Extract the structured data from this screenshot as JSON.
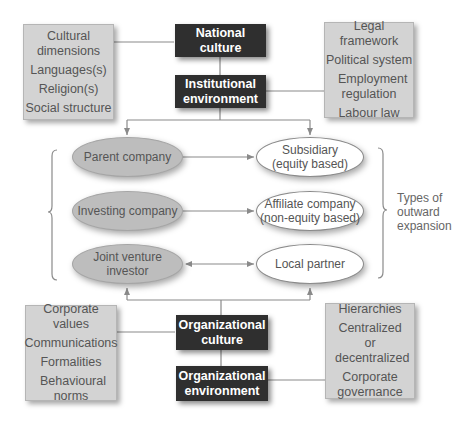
{
  "diagram": {
    "top": {
      "left_box": {
        "items": [
          "Cultural dimensions",
          "Languages(s)",
          "Religion(s)",
          "Social structure"
        ]
      },
      "national_culture": "National culture",
      "institutional_environment": [
        "Institutional",
        "environment"
      ],
      "right_box": {
        "items": [
          "Legal framework",
          "Political system",
          "Employment regulation",
          "Labour law"
        ]
      }
    },
    "middle": {
      "left_nodes": [
        "Parent company",
        "Investing company",
        "Joint venture investor"
      ],
      "right_nodes": [
        [
          "Subsidiary",
          "(equity based)"
        ],
        [
          "Affiliate company",
          "(non-equity based)"
        ],
        [
          "Local partner"
        ]
      ],
      "relations": [
        "one-way",
        "one-way",
        "two-way"
      ],
      "brace_label": [
        "Types of",
        "outward",
        "expansion"
      ]
    },
    "bottom": {
      "left_box": {
        "items": [
          "Corporate values",
          "Communications",
          "Formalities",
          "Behavioural norms"
        ]
      },
      "organizational_culture": [
        "Organizational",
        "culture"
      ],
      "organizational_environment": [
        "Organizational",
        "environment"
      ],
      "right_box": {
        "items": [
          "Hierarchies",
          "Centralized or decentralized",
          "Corporate governance"
        ]
      }
    },
    "colors": {
      "dark_box": "#2f2f2f",
      "grey_box": "#d3d3d3",
      "grey_ellipse": "#bdbdbd",
      "line": "#8a8a8a"
    }
  }
}
